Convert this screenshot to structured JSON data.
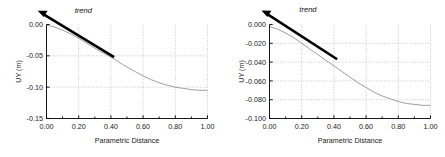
{
  "figure": {
    "panel_count": 2
  },
  "chart_data": [
    {
      "type": "line",
      "panel": "left",
      "title": "",
      "xlabel": "Parametric Distance",
      "ylabel": "UY (m)",
      "xlim": [
        0.0,
        1.0
      ],
      "ylim": [
        -0.15,
        0.0
      ],
      "grid": true,
      "legend": "none",
      "xticks": [
        "0.00",
        "0.20",
        "0.40",
        "0.60",
        "0.80",
        "1.00"
      ],
      "xtick_values": [
        0.0,
        0.2,
        0.4,
        0.6,
        0.8,
        1.0
      ],
      "yticks": [
        "0.00",
        "-0.05",
        "-0.10",
        "-0.15"
      ],
      "ytick_values": [
        0.0,
        -0.05,
        -0.1,
        -0.15
      ],
      "minor_xtick_values": [
        0.1,
        0.3,
        0.5,
        0.7,
        0.9
      ],
      "series": [
        {
          "name": "UY displacement",
          "color": "#8c8c8c",
          "x": [
            0.0,
            0.05,
            0.1,
            0.15,
            0.2,
            0.25,
            0.3,
            0.35,
            0.4,
            0.45,
            0.5,
            0.55,
            0.6,
            0.65,
            0.7,
            0.75,
            0.8,
            0.85,
            0.9,
            0.95,
            1.0
          ],
          "y": [
            -0.001,
            -0.004,
            -0.009,
            -0.015,
            -0.022,
            -0.03,
            -0.038,
            -0.045,
            -0.052,
            -0.06,
            -0.068,
            -0.075,
            -0.082,
            -0.088,
            -0.093,
            -0.097,
            -0.1,
            -0.102,
            -0.104,
            -0.105,
            -0.105
          ]
        }
      ],
      "annotations": [
        {
          "name": "trend-arrow",
          "label": "trend",
          "label_x": 0.175,
          "label_y": 0.018,
          "tail_x": 0.42,
          "tail_y": -0.052,
          "tip_x": -0.055,
          "tip_y": 0.022,
          "color": "#000000"
        }
      ]
    },
    {
      "type": "line",
      "panel": "right",
      "title": "",
      "xlabel": "Parametric Distance",
      "ylabel": "UY (m)",
      "xlim": [
        0.0,
        1.0
      ],
      "ylim": [
        -0.1,
        0.0
      ],
      "grid": true,
      "legend": "none",
      "xticks": [
        "0.00",
        "0.20",
        "0.40",
        "0.60",
        "0.80",
        "1.00"
      ],
      "xtick_values": [
        0.0,
        0.2,
        0.4,
        0.6,
        0.8,
        1.0
      ],
      "yticks": [
        "0.000",
        "-0.020",
        "-0.040",
        "-0.060",
        "-0.080",
        "-0.100"
      ],
      "ytick_values": [
        0.0,
        -0.02,
        -0.04,
        -0.06,
        -0.08,
        -0.1
      ],
      "minor_xtick_values": [
        0.1,
        0.3,
        0.5,
        0.7,
        0.9
      ],
      "series": [
        {
          "name": "UY displacement",
          "color": "#8c8c8c",
          "x": [
            0.0,
            0.05,
            0.1,
            0.15,
            0.2,
            0.25,
            0.3,
            0.35,
            0.4,
            0.45,
            0.5,
            0.55,
            0.6,
            0.65,
            0.7,
            0.75,
            0.8,
            0.85,
            0.9,
            0.95,
            1.0
          ],
          "y": [
            -0.002,
            -0.005,
            -0.009,
            -0.014,
            -0.02,
            -0.026,
            -0.032,
            -0.038,
            -0.044,
            -0.05,
            -0.056,
            -0.062,
            -0.067,
            -0.072,
            -0.076,
            -0.079,
            -0.082,
            -0.084,
            -0.085,
            -0.086,
            -0.086
          ]
        }
      ],
      "annotations": [
        {
          "name": "trend-arrow",
          "label": "trend",
          "label_x": 0.185,
          "label_y": 0.013,
          "tail_x": 0.42,
          "tail_y": -0.037,
          "tip_x": -0.05,
          "tip_y": 0.015,
          "color": "#000000"
        }
      ]
    }
  ]
}
